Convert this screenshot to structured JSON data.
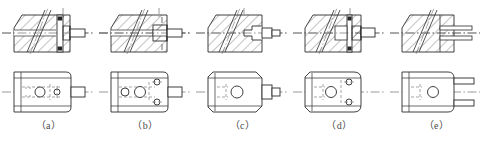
{
  "sheet": {
    "title": "Sectional views exercise figures (a)-(e)",
    "background_color": "#ffffff",
    "line_color": "#2b2b2b",
    "hatch_color": "#3a3a3a",
    "center_line_color": "#555555",
    "hidden_line_color": "#6a6a6a",
    "caption_color": "#4a4a4a"
  },
  "figures": [
    {
      "id": "a",
      "caption": "（a）",
      "x": 0,
      "top_view": {
        "name": "front-sectional-view",
        "hatching": "diagonal-45-full",
        "features": [
          "rectangular body with chamfered top-left corner",
          "inclined through slot shown by two parallel slanted lines",
          "vertical flange web at right with two dark keyway blocks",
          "horizontal cylindrical boss projecting right",
          "horizontal centre line through boss"
        ]
      },
      "bottom_view": {
        "name": "top-plan-view",
        "features": [
          "rectangle with rounded right corners",
          "large centre circle",
          "small right circle",
          "hidden bore lines",
          "rectangular tongue projecting right",
          "horizontal centre line"
        ]
      }
    },
    {
      "id": "b",
      "caption": "（b）",
      "x": 97,
      "top_view": {
        "name": "front-sectional-view",
        "hatching": "diagonal-45-full",
        "features": [
          "rectangular body with chamfered top-left corner",
          "inclined through slot shown by two parallel slanted lines",
          "stepped recess at right with hatched plug",
          "horizontal cylindrical boss projecting right",
          "short vertical dashes at right edge",
          "horizontal centre line through boss"
        ]
      },
      "bottom_view": {
        "name": "top-plan-view",
        "features": [
          "rectangle with rounded right corners",
          "left circle",
          "large centre circle",
          "two small circles at right",
          "hidden bore lines",
          "rectangular tongue projecting right",
          "horizontal centre line"
        ]
      }
    },
    {
      "id": "c",
      "caption": "（c）",
      "x": 194,
      "top_view": {
        "name": "front-sectional-view",
        "hatching": "diagonal-45-full",
        "features": [
          "rectangular body with chamfered top-left corner",
          "inclined through slot shown by two parallel slanted lines",
          "stepped arrow-shaped notch at right",
          "horizontal cylindrical boss projecting right",
          "horizontal centre line through boss"
        ]
      },
      "bottom_view": {
        "name": "top-plan-view",
        "features": [
          "rectangle with chamfered left corners",
          "large centre circle",
          "hidden bore lines at left",
          "stepped rectangular boss projecting right",
          "horizontal centre line"
        ]
      }
    },
    {
      "id": "d",
      "caption": "（d）",
      "x": 291,
      "top_view": {
        "name": "front-sectional-view",
        "hatching": "diagonal-45-full",
        "features": [
          "rectangular body with chamfered top-left corner",
          "inclined through slot shown by two parallel slanted lines",
          "narrow vertical rib at right with two dark blocks",
          "horizontal rectangular boss projecting right",
          "horizontal centre line through boss"
        ]
      },
      "bottom_view": {
        "name": "top-plan-view",
        "features": [
          "rectangle with chamfered left corners and rounded right end",
          "large centre circle",
          "two small circles at right",
          "hidden bore lines at left",
          "horizontal centre line"
        ]
      }
    },
    {
      "id": "e",
      "caption": "（e）",
      "x": 388,
      "top_view": {
        "name": "front-sectional-view",
        "hatching": "diagonal-45-full",
        "features": [
          "rectangular body with chamfered top-left corner",
          "inclined through slot shown by two parallel slanted lines",
          "vertical division line near right",
          "two thin horizontal prongs projecting right",
          "horizontal centre line through prongs"
        ]
      },
      "bottom_view": {
        "name": "top-plan-view",
        "features": [
          "rectangle with rounded right corners",
          "large centre circle",
          "hidden bore lines at left",
          "two thin prongs projecting right",
          "horizontal centre line"
        ]
      }
    }
  ]
}
